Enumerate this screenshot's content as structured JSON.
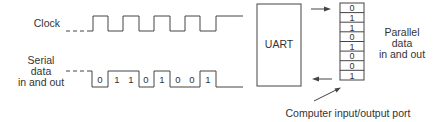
{
  "labels": {
    "clock": "Clock",
    "serial_line1": "Serial",
    "serial_line2": "data",
    "serial_line3": "in and out",
    "uart": "UART",
    "parallel_line1": "Parallel",
    "parallel_line2": "data",
    "parallel_line3": "in and out",
    "port": "Computer input/output port"
  },
  "serial_bits": [
    "0",
    "1",
    "1",
    "0",
    "1",
    "0",
    "0",
    "1"
  ],
  "register_bits": [
    "0",
    "1",
    "1",
    "0",
    "1",
    "0",
    "0",
    "1"
  ],
  "arrows": {
    "top": "right-arrow",
    "bottom": "left-arrow"
  }
}
